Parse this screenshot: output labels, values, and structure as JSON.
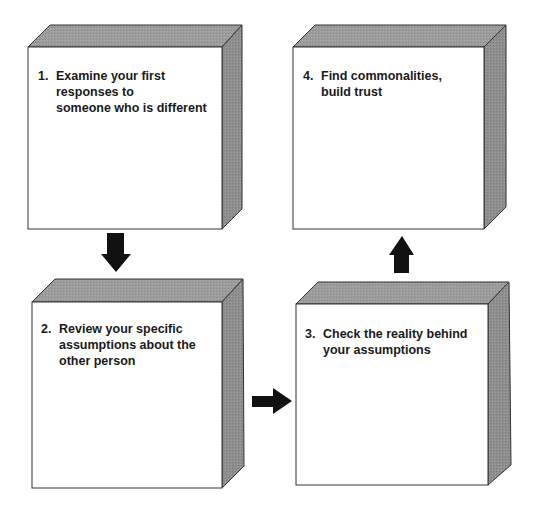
{
  "diagram": {
    "type": "process-flow",
    "colors": {
      "background": "#ffffff",
      "front_face": "#ffffff",
      "top_face": "#9a9a9a",
      "side_face": "#8c8c8c",
      "edge": "#333333",
      "arrow": "#111111",
      "text": "#1a1a1a"
    },
    "steps": [
      {
        "number": "1.",
        "text": "Examine your first\nresponses to\nsomeone who is different"
      },
      {
        "number": "2.",
        "text": "Review your specific\nassumptions about the\nother person"
      },
      {
        "number": "3.",
        "text": "Check the reality behind\nyour assumptions"
      },
      {
        "number": "4.",
        "text": "Find commonalities,\nbuild trust"
      }
    ],
    "arrows": [
      {
        "from": "1.",
        "to": "2.",
        "direction": "down"
      },
      {
        "from": "2.",
        "to": "3.",
        "direction": "right"
      },
      {
        "from": "3.",
        "to": "4.",
        "direction": "up"
      }
    ]
  }
}
